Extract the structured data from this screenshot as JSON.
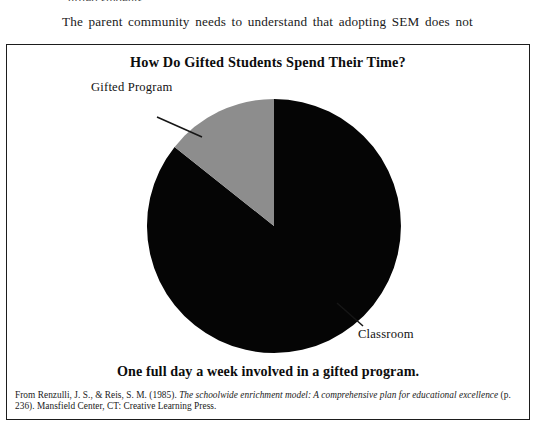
{
  "page": {
    "background": "#ffffff",
    "ink": "#111111"
  },
  "body_text": {
    "clipped_line_above": "gifted students.",
    "paragraph_line": "The parent community needs to understand that adopting SEM does not"
  },
  "figure": {
    "title": "How Do Gifted Students Spend Their Time?",
    "caption": "One full day a week involved in a gifted program.",
    "border_color": "#1d1d1d",
    "labels": {
      "gifted": "Gifted Program",
      "classroom": "Classroom"
    },
    "source": {
      "prefix": "From Renzulli, J. S., & Reis, S. M. (1985). ",
      "italic_title": "The schoolwide enrichment model: A comprehensive plan for educational excellence",
      "page_ref": " (p. 236). ",
      "publisher": "Mansfield Center, CT: Creative Learning Press."
    }
  },
  "chart_data": {
    "type": "pie",
    "title": "How Do Gifted Students Spend Their Time?",
    "categories": [
      "Classroom",
      "Gifted Program"
    ],
    "values": [
      85.7,
      14.3
    ],
    "value_unit": "percent",
    "raw_values": [
      6,
      1
    ],
    "raw_unit": "days per week",
    "colors": [
      "#050505",
      "#8d8d8d"
    ],
    "labels": [
      "Classroom",
      "Gifted Program"
    ],
    "legend": "none",
    "annotations": [
      "One full day a week involved in a gifted program."
    ],
    "start_angle_deg": 0,
    "direction": "counterclockwise",
    "geometry": {
      "center_x": 267,
      "center_y": 181,
      "radius": 127
    }
  }
}
